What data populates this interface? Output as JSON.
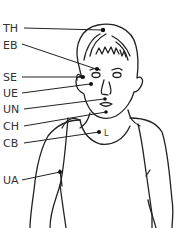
{
  "diagram": {
    "type": "tapping-points-figure",
    "line_color": "#222222",
    "points": [
      {
        "label": "TH",
        "meaning_icon": "top-of-head-point",
        "label_x": 3,
        "label_y": 23
      },
      {
        "label": "EB",
        "meaning_icon": "eyebrow-point",
        "label_x": 3,
        "label_y": 40
      },
      {
        "label": "SE",
        "meaning_icon": "side-of-eye-point",
        "label_x": 3,
        "label_y": 72
      },
      {
        "label": "UE",
        "meaning_icon": "under-eye-point",
        "label_x": 3,
        "label_y": 88
      },
      {
        "label": "UN",
        "meaning_icon": "under-nose-point",
        "label_x": 3,
        "label_y": 104
      },
      {
        "label": "CH",
        "meaning_icon": "chin-point",
        "label_x": 3,
        "label_y": 121
      },
      {
        "label": "CB",
        "meaning_icon": "collarbone-point",
        "label_x": 3,
        "label_y": 138
      },
      {
        "label": "UA",
        "meaning_icon": "under-arm-point",
        "label_x": 3,
        "label_y": 175
      }
    ],
    "collarbone_mark": "L"
  }
}
